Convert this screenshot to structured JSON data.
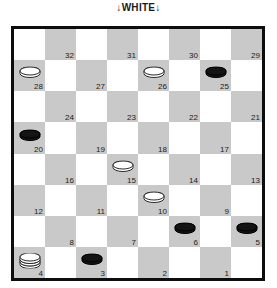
{
  "caption": "↓WHITE↓",
  "board": {
    "rows": 8,
    "cols": 8,
    "light_color": "#ffffff",
    "dark_color": "#c9c9c9",
    "border_color": "#0d0d0d",
    "white_piece_color": "#ffffff",
    "black_piece_color": "#141414",
    "numbering_note": "dark playable squares numbered 32..29 top row down to 4..1 bottom row",
    "squares": [
      {
        "n": 32,
        "row": 0,
        "col": 1,
        "piece": null
      },
      {
        "n": 31,
        "row": 0,
        "col": 3,
        "piece": null
      },
      {
        "n": 30,
        "row": 0,
        "col": 5,
        "piece": null
      },
      {
        "n": 29,
        "row": 0,
        "col": 7,
        "piece": null
      },
      {
        "n": 28,
        "row": 1,
        "col": 0,
        "piece": "white-man"
      },
      {
        "n": 27,
        "row": 1,
        "col": 2,
        "piece": null
      },
      {
        "n": 26,
        "row": 1,
        "col": 4,
        "piece": "white-man"
      },
      {
        "n": 25,
        "row": 1,
        "col": 6,
        "piece": "black-man"
      },
      {
        "n": 24,
        "row": 2,
        "col": 1,
        "piece": null
      },
      {
        "n": 23,
        "row": 2,
        "col": 3,
        "piece": null
      },
      {
        "n": 22,
        "row": 2,
        "col": 5,
        "piece": null
      },
      {
        "n": 21,
        "row": 2,
        "col": 7,
        "piece": null
      },
      {
        "n": 20,
        "row": 3,
        "col": 0,
        "piece": "black-man"
      },
      {
        "n": 19,
        "row": 3,
        "col": 2,
        "piece": null
      },
      {
        "n": 18,
        "row": 3,
        "col": 4,
        "piece": null
      },
      {
        "n": 17,
        "row": 3,
        "col": 6,
        "piece": null
      },
      {
        "n": 16,
        "row": 4,
        "col": 1,
        "piece": null
      },
      {
        "n": 15,
        "row": 4,
        "col": 3,
        "piece": "white-man"
      },
      {
        "n": 14,
        "row": 4,
        "col": 5,
        "piece": null
      },
      {
        "n": 13,
        "row": 4,
        "col": 7,
        "piece": null
      },
      {
        "n": 12,
        "row": 5,
        "col": 0,
        "piece": null
      },
      {
        "n": 11,
        "row": 5,
        "col": 2,
        "piece": null
      },
      {
        "n": 10,
        "row": 5,
        "col": 4,
        "piece": "white-man"
      },
      {
        "n": 9,
        "row": 5,
        "col": 6,
        "piece": null
      },
      {
        "n": 8,
        "row": 6,
        "col": 1,
        "piece": null
      },
      {
        "n": 7,
        "row": 6,
        "col": 3,
        "piece": null
      },
      {
        "n": 6,
        "row": 6,
        "col": 5,
        "piece": "black-man"
      },
      {
        "n": 5,
        "row": 6,
        "col": 7,
        "piece": "black-man"
      },
      {
        "n": 4,
        "row": 7,
        "col": 0,
        "piece": "white-king"
      },
      {
        "n": 3,
        "row": 7,
        "col": 2,
        "piece": "black-man"
      },
      {
        "n": 2,
        "row": 7,
        "col": 4,
        "piece": null
      },
      {
        "n": 1,
        "row": 7,
        "col": 6,
        "piece": null
      }
    ]
  }
}
